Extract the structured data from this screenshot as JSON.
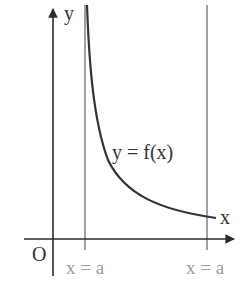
{
  "diagram": {
    "axes": {
      "x_label": "x",
      "y_label": "y",
      "origin_label": "O"
    },
    "curve_label": "y = f(x)",
    "asymptote_labels": [
      "x = a",
      "x = a"
    ],
    "colors": {
      "axis": "#2b2b2b",
      "curve": "#333333",
      "asymptote": "#9e9e9e",
      "grey_text": "#9a9a9a"
    }
  }
}
